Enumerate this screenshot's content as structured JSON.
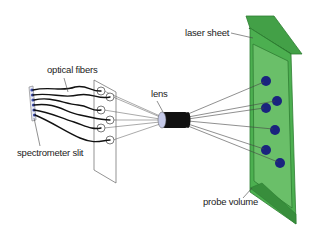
{
  "diagram": {
    "type": "optical setup schematic",
    "labels": {
      "optical_fibers": "optical fibers",
      "spectrometer_slit": "spectrometer slit",
      "lens": "lens",
      "laser_sheet": "laser sheet",
      "probe_volume": "probe volume"
    },
    "colors": {
      "laser_sheet_fill": "#4caf50",
      "laser_sheet_dark": "#2e7d32",
      "laser_sheet_inner": "#66bb6a",
      "probe_points": "#1a237e",
      "slit_points": "#3949ab",
      "lens_face": "#c5cae9",
      "lens_body": "#111111",
      "lines": "#333333"
    },
    "probe_point_count": 6,
    "fiber_count": 6
  }
}
